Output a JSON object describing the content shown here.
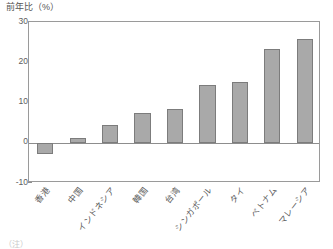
{
  "chart_data": {
    "type": "bar",
    "title": "前年比（%）",
    "xlabel": "",
    "ylabel": "前年比（%）",
    "ylim": [
      -10,
      30
    ],
    "yticks": [
      -10,
      0,
      10,
      20,
      30
    ],
    "ytick_labels": [
      "-10",
      "0",
      "10",
      "20",
      "30"
    ],
    "grid": false,
    "legend": null,
    "categories": [
      "香港",
      "中国",
      "インドネシア",
      "韓国",
      "台湾",
      "シンガポール",
      "タイ",
      "ベトナム",
      "マレーシア"
    ],
    "values": [
      -2.7,
      1.3,
      4.3,
      7.3,
      8.5,
      14.3,
      15.2,
      23.3,
      25.7
    ],
    "bar_color": "#a9a9a9",
    "bar_edge_color": "#7c7c7c",
    "axis_color": "#9a9a9a",
    "text_color": "#5a5a5a"
  },
  "caption": {
    "text": "（注）"
  }
}
